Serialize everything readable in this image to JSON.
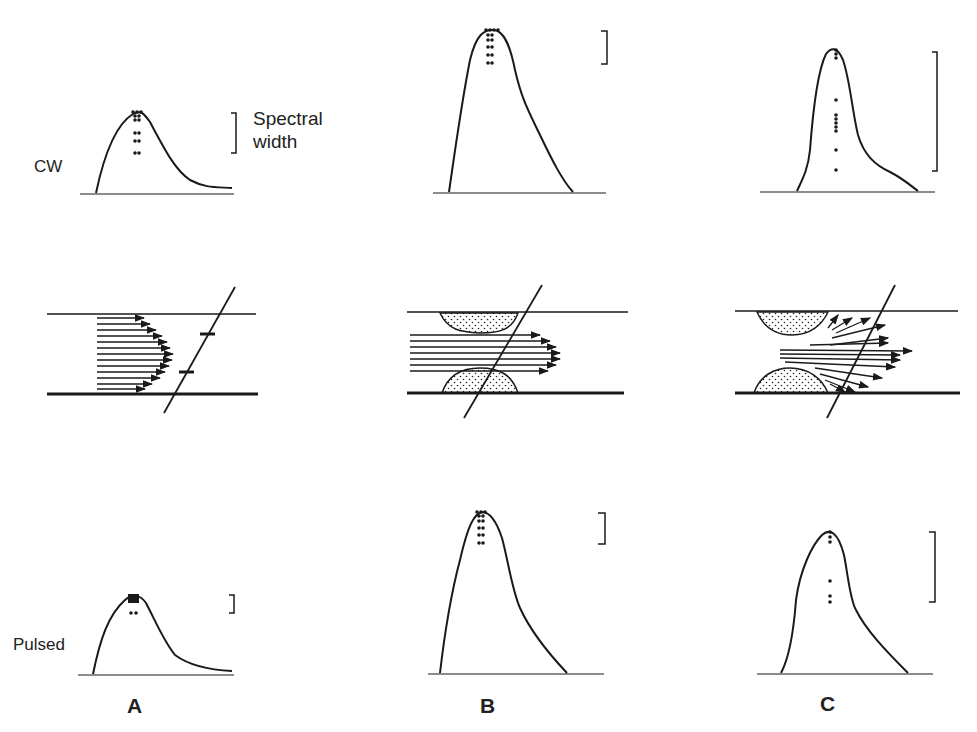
{
  "labels": {
    "row_top": "CW",
    "row_bottom": "Pulsed",
    "spectral_line1": "Spectral",
    "spectral_line2": "width",
    "columns": [
      "A",
      "B",
      "C"
    ]
  },
  "panels": [
    {
      "column": "A",
      "cw_spectrum": "narrow spectrum, small bracket",
      "flow": "parabolic laminar profile in vessel",
      "pulsed_spectrum": "very narrow, small bracket"
    },
    {
      "column": "B",
      "cw_spectrum": "taller spectrum, small bracket",
      "flow": "stenosis with plug-like high-velocity jet",
      "pulsed_spectrum": "tall spectrum, small bracket"
    },
    {
      "column": "C",
      "cw_spectrum": "spectral broadening, large bracket",
      "flow": "stenosis with disturbed/turbulent flow vectors",
      "pulsed_spectrum": "broadened, large bracket"
    }
  ],
  "colors": {
    "ink": "#1a1a1a",
    "background": "#ffffff"
  }
}
